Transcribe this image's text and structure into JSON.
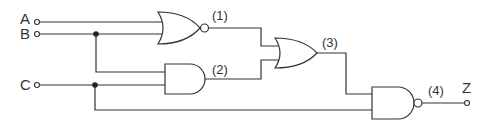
{
  "diagram": {
    "type": "logic-circuit",
    "inputs": [
      {
        "id": "A",
        "label": "A"
      },
      {
        "id": "B",
        "label": "B"
      },
      {
        "id": "C",
        "label": "C"
      }
    ],
    "output": {
      "id": "Z",
      "label": "Z"
    },
    "gates": [
      {
        "id": "1",
        "type": "NOR",
        "label": "(1)",
        "inputs": [
          "A",
          "B"
        ]
      },
      {
        "id": "2",
        "type": "AND",
        "label": "(2)",
        "inputs": [
          "B",
          "C"
        ]
      },
      {
        "id": "3",
        "type": "OR",
        "label": "(3)",
        "inputs": [
          "(1)",
          "(2)"
        ]
      },
      {
        "id": "4",
        "type": "NAND",
        "label": "(4)",
        "inputs": [
          "(3)",
          "C"
        ],
        "output": "Z"
      }
    ],
    "colors": {
      "line": "#333333",
      "background": "#ffffff"
    }
  }
}
